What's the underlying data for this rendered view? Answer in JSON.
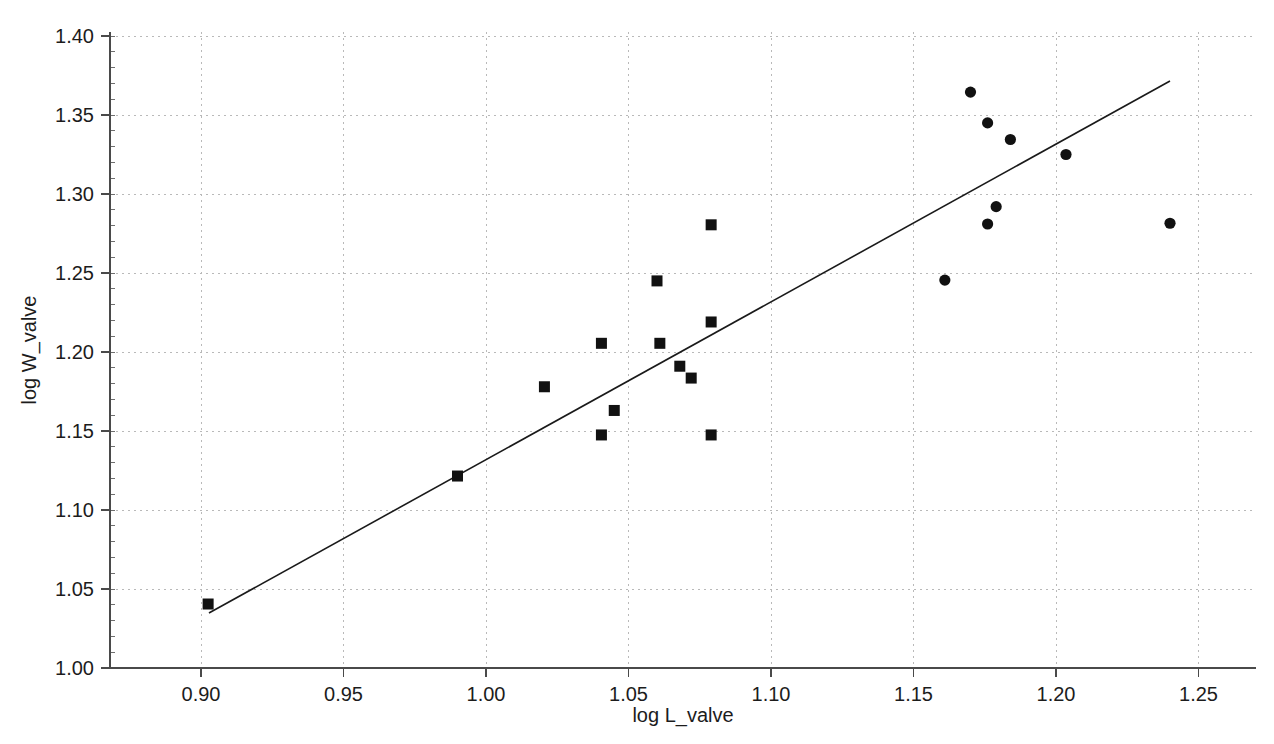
{
  "chart_data": {
    "type": "scatter",
    "title": "",
    "xlabel": "log L_valve",
    "ylabel": "log W_valve",
    "xlim": [
      0.872,
      0.891
    ],
    "ylim": [
      1.0,
      1.4
    ],
    "xticks": [
      "0.90",
      "0.95",
      "1.00",
      "1.05",
      "1.10",
      "1.15",
      "1.20",
      "1.25"
    ],
    "yticks": [
      "1.00",
      "1.05",
      "1.10",
      "1.15",
      "1.20",
      "1.25",
      "1.30",
      "1.35",
      "1.40"
    ],
    "grid": true,
    "legend": "none",
    "series": [
      {
        "name": "group-square",
        "marker": "square",
        "points": [
          {
            "x": 0.9025,
            "y": 1.0405
          },
          {
            "x": 0.99,
            "y": 1.1215
          },
          {
            "x": 1.0205,
            "y": 1.178
          },
          {
            "x": 1.0405,
            "y": 1.2055
          },
          {
            "x": 1.0405,
            "y": 1.1475
          },
          {
            "x": 1.045,
            "y": 1.163
          },
          {
            "x": 1.06,
            "y": 1.245
          },
          {
            "x": 1.061,
            "y": 1.2055
          },
          {
            "x": 1.068,
            "y": 1.191
          },
          {
            "x": 1.072,
            "y": 1.1835
          },
          {
            "x": 1.079,
            "y": 1.2805
          },
          {
            "x": 1.079,
            "y": 1.219
          },
          {
            "x": 1.079,
            "y": 1.1475
          }
        ]
      },
      {
        "name": "group-circle",
        "marker": "circle",
        "points": [
          {
            "x": 1.161,
            "y": 1.2455
          },
          {
            "x": 1.17,
            "y": 1.3645
          },
          {
            "x": 1.176,
            "y": 1.345
          },
          {
            "x": 1.176,
            "y": 1.281
          },
          {
            "x": 1.179,
            "y": 1.292
          },
          {
            "x": 1.184,
            "y": 1.3345
          },
          {
            "x": 1.2035,
            "y": 1.325
          },
          {
            "x": 1.24,
            "y": 1.2815
          }
        ]
      }
    ],
    "fit_line": {
      "name": "regression-line",
      "x1": 0.9028,
      "y1": 1.0348,
      "x2": 1.24,
      "y2": 1.3715
    }
  }
}
